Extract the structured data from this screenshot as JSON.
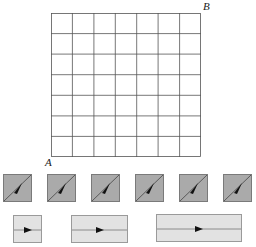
{
  "grid": {
    "rows": 7,
    "cols": 7,
    "corner_labels": {
      "bottom_left": "A",
      "top_right": "B"
    },
    "line_color": "#555555"
  },
  "diagonal_tiles": {
    "count": 6,
    "fill": "#aaaaaa",
    "direction": "up-right"
  },
  "straight_tiles": {
    "count": 3,
    "fill": "#e2e2e2",
    "widths_in_units": [
      1,
      2,
      3
    ],
    "direction": "right"
  }
}
